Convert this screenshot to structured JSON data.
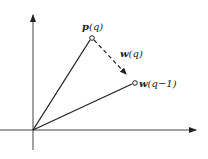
{
  "diagram": {
    "type": "vector-diagram",
    "colors": {
      "line": "#222222",
      "background": "#ffffff"
    },
    "axes": {
      "x_axis": {
        "from": [
          0,
          130
        ],
        "to": [
          197,
          130
        ]
      },
      "y_axis": {
        "from": [
          33,
          150
        ],
        "to": [
          33,
          14
        ]
      },
      "origin": [
        33,
        130
      ]
    },
    "points": {
      "p": {
        "label_bold": "p",
        "label_rest": "(q)",
        "pos": [
          92,
          38
        ]
      },
      "w_prev": {
        "label_bold": "w",
        "label_rest": "(q−1)",
        "pos": [
          135,
          83
        ]
      }
    },
    "edges": [
      {
        "name": "origin-to-p",
        "style": "solid"
      },
      {
        "name": "origin-to-w_prev",
        "style": "solid"
      },
      {
        "name": "p-to-w_prev",
        "style": "dashed",
        "label_bold": "w",
        "label_rest": "(q)"
      }
    ],
    "labels": {
      "p": "p(q)",
      "w_q": "w(q)",
      "w_prev": "w(q−1)"
    }
  }
}
